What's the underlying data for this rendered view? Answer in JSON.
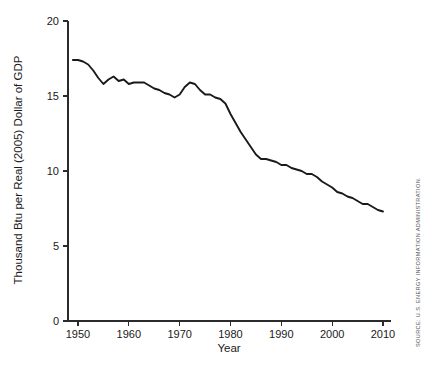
{
  "chart_data": {
    "type": "line",
    "title": "",
    "xlabel": "Year",
    "ylabel": "Thousand Btu per Real (2005) Dollar of GDP",
    "xlim": [
      1948,
      2011
    ],
    "ylim": [
      0,
      20
    ],
    "grid": false,
    "legend": "none",
    "xticks": [
      1950,
      1960,
      1970,
      1980,
      1990,
      2000,
      2010
    ],
    "xtick_labels": [
      "1950",
      "1960",
      "1970",
      "1980",
      "1990",
      "2000",
      "2010"
    ],
    "yticks": [
      0,
      5,
      10,
      15,
      20
    ],
    "ytick_labels": [
      "0",
      "5",
      "10",
      "15",
      "20"
    ],
    "series": [
      {
        "name": "Energy Intensity",
        "color": "#1a1a1a",
        "x": [
          1949,
          1950,
          1951,
          1952,
          1953,
          1954,
          1955,
          1956,
          1957,
          1958,
          1959,
          1960,
          1961,
          1962,
          1963,
          1964,
          1965,
          1966,
          1967,
          1968,
          1969,
          1970,
          1971,
          1972,
          1973,
          1974,
          1975,
          1976,
          1977,
          1978,
          1979,
          1980,
          1981,
          1982,
          1983,
          1984,
          1985,
          1986,
          1987,
          1988,
          1989,
          1990,
          1991,
          1992,
          1993,
          1994,
          1995,
          1996,
          1997,
          1998,
          1999,
          2000,
          2001,
          2002,
          2003,
          2004,
          2005,
          2006,
          2007,
          2008,
          2009,
          2010
        ],
        "values": [
          17.4,
          17.4,
          17.3,
          17.1,
          16.7,
          16.2,
          15.8,
          16.1,
          16.3,
          16.0,
          16.1,
          15.8,
          15.9,
          15.9,
          15.9,
          15.7,
          15.5,
          15.4,
          15.2,
          15.1,
          14.9,
          15.1,
          15.6,
          15.9,
          15.8,
          15.4,
          15.1,
          15.1,
          14.9,
          14.8,
          14.5,
          13.8,
          13.2,
          12.6,
          12.1,
          11.6,
          11.1,
          10.8,
          10.8,
          10.7,
          10.6,
          10.4,
          10.4,
          10.2,
          10.1,
          10.0,
          9.8,
          9.8,
          9.6,
          9.3,
          9.1,
          8.9,
          8.6,
          8.5,
          8.3,
          8.2,
          8.0,
          7.8,
          7.8,
          7.6,
          7.4,
          7.3
        ]
      }
    ],
    "annotations": {
      "source": "SOURCE: U.S. ENERGY INFORMATION ADMINISTRATION."
    }
  }
}
